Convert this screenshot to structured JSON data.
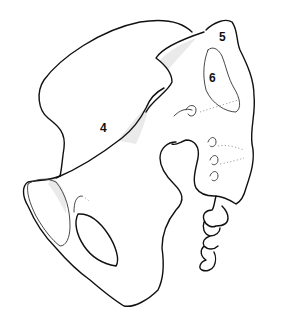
{
  "figure": {
    "stroke_color": "#111111",
    "background": "#ffffff",
    "labels": [
      {
        "id": "4",
        "text": "4",
        "x": 100,
        "y": 122
      },
      {
        "id": "5",
        "text": "5",
        "x": 219,
        "y": 31
      },
      {
        "id": "6",
        "text": "6",
        "x": 209,
        "y": 72
      }
    ]
  }
}
